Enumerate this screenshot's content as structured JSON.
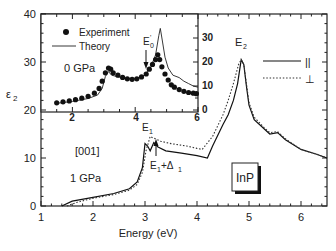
{
  "chart_data": [
    {
      "type": "line",
      "title": "",
      "xlabel": "Energy (eV)",
      "ylabel": "ε2",
      "xlim": [
        1,
        6.5
      ],
      "ylim": [
        0,
        40
      ],
      "xticks": [
        "1",
        "2",
        "3",
        "4",
        "5",
        "6"
      ],
      "yticks": [
        "0",
        "10",
        "20",
        "30",
        "40"
      ],
      "grid": false,
      "annotations": [
        "[001]",
        "1 GPa",
        "E1",
        "E1+Δ1",
        "E2",
        "InP"
      ],
      "legend": {
        "position": "right",
        "entries": [
          "||",
          "⊥"
        ]
      },
      "series": [
        {
          "name": "||",
          "style": "solid",
          "x": [
            1.4,
            1.6,
            2.0,
            2.4,
            2.7,
            2.85,
            2.95,
            3.0,
            3.05,
            3.1,
            3.17,
            3.25,
            3.4,
            3.7,
            4.0,
            4.2,
            4.3,
            4.5,
            4.6,
            4.7,
            4.78,
            4.85,
            4.9,
            4.95,
            5.0,
            5.1,
            5.3,
            5.4,
            5.55,
            5.7,
            6.0,
            6.3,
            6.5
          ],
          "y": [
            0,
            1.0,
            1.8,
            2.6,
            3.6,
            5.0,
            8.0,
            13.0,
            12.5,
            11.5,
            13.2,
            12.3,
            11.5,
            11.0,
            10.5,
            10.0,
            12.5,
            17.0,
            19.0,
            22.0,
            25.5,
            30.5,
            29.5,
            25.0,
            21.0,
            18.0,
            16.0,
            15.0,
            15.3,
            13.8,
            11.8,
            10.8,
            10.0
          ]
        },
        {
          "name": "⊥",
          "style": "dotted",
          "x": [
            1.5,
            1.7,
            2.0,
            2.4,
            2.7,
            2.85,
            2.95,
            3.02,
            3.1,
            3.15,
            3.2,
            3.3,
            3.5,
            3.8,
            4.0,
            4.1,
            4.3,
            4.5,
            4.6,
            4.7,
            4.8,
            4.85,
            4.9,
            5.0,
            5.1,
            5.3,
            5.4,
            5.55,
            5.7,
            6.0,
            6.3,
            6.5
          ],
          "y": [
            0,
            0.8,
            1.6,
            2.4,
            3.3,
            4.5,
            7.0,
            11.5,
            14.5,
            14.2,
            14.0,
            13.5,
            13.0,
            12.5,
            12.0,
            11.8,
            14.5,
            19.0,
            22.0,
            25.5,
            29.5,
            30.5,
            29.5,
            21.5,
            18.5,
            16.2,
            15.3,
            15.5,
            14.0,
            11.8,
            10.8,
            10.0
          ]
        }
      ]
    },
    {
      "type": "scatter",
      "title": "inset",
      "xlabel": "",
      "ylabel": "",
      "xlim": [
        1,
        6
      ],
      "ylim": [
        20,
        40
      ],
      "right_ylim": [
        0,
        35
      ],
      "xticks": [
        "2",
        "4",
        "6"
      ],
      "right_yticks": [
        "0",
        "10",
        "20",
        "30"
      ],
      "annotations": [
        "0 GPa",
        "E'0"
      ],
      "legend": {
        "position": "upper left",
        "entries": [
          "Experiment",
          "Theory"
        ]
      },
      "series": [
        {
          "name": "Experiment",
          "style": "markers",
          "x": [
            1.5,
            1.7,
            1.9,
            2.1,
            2.3,
            2.5,
            2.7,
            2.85,
            2.95,
            3.05,
            3.15,
            3.22,
            3.3,
            3.45,
            3.6,
            3.75,
            3.9,
            4.05,
            4.2,
            4.35,
            4.45,
            4.55,
            4.65,
            4.72,
            4.78,
            4.85,
            4.95,
            5.05,
            5.15,
            5.25,
            5.4,
            5.55,
            5.7,
            5.85,
            5.95
          ],
          "y": [
            3.0,
            3.4,
            3.8,
            4.3,
            4.9,
            5.7,
            7.0,
            9.0,
            12.0,
            15.5,
            17.5,
            17.0,
            15.5,
            14.5,
            13.6,
            13.0,
            12.8,
            13.0,
            13.8,
            15.0,
            17.0,
            19.0,
            21.0,
            23.0,
            21.0,
            18.0,
            15.0,
            12.5,
            10.5,
            9.5,
            8.5,
            7.8,
            7.3,
            7.0,
            6.8
          ]
        },
        {
          "name": "Theory",
          "style": "solid",
          "x": [
            1.5,
            2.0,
            2.5,
            2.8,
            2.95,
            3.05,
            3.15,
            3.25,
            3.4,
            3.7,
            4.0,
            4.3,
            4.5,
            4.65,
            4.75,
            4.8,
            4.85,
            4.95,
            5.05,
            5.2,
            5.4,
            5.55,
            5.7,
            5.85,
            6.0
          ],
          "y": [
            2.8,
            3.6,
            4.8,
            6.2,
            9.0,
            14.0,
            16.0,
            14.5,
            14.0,
            13.2,
            13.0,
            14.5,
            18.0,
            23.0,
            31.0,
            34.0,
            30.0,
            22.0,
            17.5,
            14.5,
            13.5,
            12.0,
            11.0,
            10.0,
            9.5
          ]
        }
      ]
    }
  ],
  "labels": {
    "ylabel": "ε",
    "ylabel_sub": "2",
    "xlabel": "Energy (eV)",
    "orientation": "[001]",
    "pressure_main": "1 GPa",
    "pressure_inset": "0 GPa",
    "e1": "E",
    "e1_sub": "1",
    "e1d": "E",
    "e1d_sub": "1",
    "e1d_plus": "+Δ",
    "e1d_sub2": "1",
    "e2": "E",
    "e2_sub": "2",
    "e0p": "E",
    "e0p_sub": "0",
    "e0p_prime": "'",
    "material": "InP",
    "legend_par": "||",
    "legend_perp": "⊥",
    "legend_exp": "Experiment",
    "legend_theory": "Theory"
  },
  "ticks": {
    "main_x": [
      "1",
      "2",
      "3",
      "4",
      "5",
      "6"
    ],
    "main_y": [
      "0",
      "10",
      "20",
      "30",
      "40"
    ],
    "inset_x": [
      "2",
      "4",
      "6"
    ],
    "inset_y": [
      "0",
      "10",
      "20",
      "30"
    ]
  }
}
